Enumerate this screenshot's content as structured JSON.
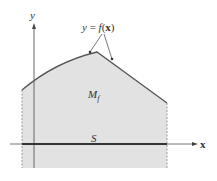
{
  "diagram": {
    "axes": {
      "x_label": "x",
      "y_label": "y"
    },
    "curve_label": {
      "lhs": "y",
      "eq": " = ",
      "func": "f",
      "open": "(",
      "arg": "x",
      "close": ")"
    },
    "region_label": {
      "main": "M",
      "sub": "f"
    },
    "base_label": "S",
    "colors": {
      "fill": "#e2e2e2",
      "curve": "#555555",
      "axis": "#666666",
      "base": "#333333",
      "dashed": "#999999"
    }
  }
}
